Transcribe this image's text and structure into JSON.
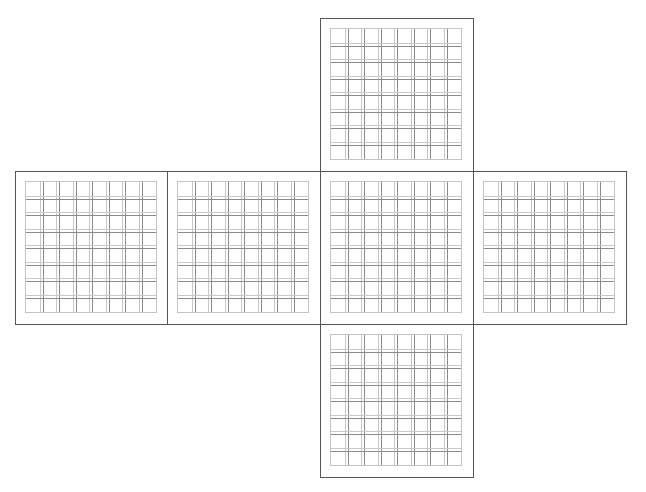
{
  "diagram": {
    "header_text": "",
    "type": "cube-net",
    "colors": {
      "face_border": "#555555",
      "grid_border": "#c4c4c4",
      "grid_line_light": "#c8c8c8",
      "grid_line_dark": "#8a8a8a",
      "background": "#ffffff"
    },
    "grid": {
      "columns": 8,
      "rows": 8,
      "doubled_inner_lines": true
    },
    "faces": [
      {
        "id": "top",
        "x": 320,
        "y": 18
      },
      {
        "id": "left",
        "x": 15,
        "y": 171
      },
      {
        "id": "left-center",
        "x": 167,
        "y": 171
      },
      {
        "id": "center",
        "x": 320,
        "y": 171
      },
      {
        "id": "right",
        "x": 473,
        "y": 171
      },
      {
        "id": "bottom",
        "x": 320,
        "y": 324
      }
    ]
  }
}
